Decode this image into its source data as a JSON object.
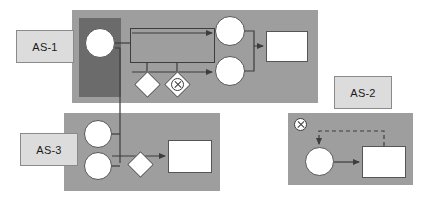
{
  "diagram": {
    "colors": {
      "panel_fill": "#9e9e9e",
      "panel_dark_fill": "#6b6b6b",
      "label_fill": "#dcdcdc",
      "label_border": "#8a8a8a",
      "node_fill": "#ffffff",
      "node_border": "#555555",
      "edge_stroke": "#3d3d3d",
      "background": "#ffffff"
    },
    "panels": [
      {
        "name": "as1-panel",
        "label": "AS-1",
        "x": 72,
        "y": 10,
        "width": 246,
        "height": 93,
        "fill": "#9e9e9e"
      },
      {
        "name": "as1-dark-overlay",
        "label": "",
        "x": 79,
        "y": 18,
        "width": 42,
        "height": 79,
        "fill": "#6b6b6b"
      },
      {
        "name": "as3-panel",
        "label": "AS-3",
        "x": 64,
        "y": 113,
        "width": 156,
        "height": 78,
        "fill": "#9e9e9e"
      },
      {
        "name": "as2-panel",
        "label": "AS-2",
        "x": 288,
        "y": 113,
        "width": 125,
        "height": 72,
        "fill": "#9e9e9e"
      }
    ],
    "labels": [
      {
        "name": "as1-label",
        "text": "AS-1",
        "x": 16,
        "y": 30,
        "width": 58,
        "height": 33
      },
      {
        "name": "as3-label",
        "text": "AS-3",
        "x": 20,
        "y": 133,
        "width": 58,
        "height": 33
      },
      {
        "name": "as2-label",
        "text": "AS-2",
        "x": 334,
        "y": 76,
        "width": 58,
        "height": 33
      }
    ],
    "nodes": [
      {
        "name": "as1-start-event",
        "type": "circle",
        "x": 85,
        "y": 28,
        "size": 30
      },
      {
        "name": "as1-task-upper-event",
        "type": "circle",
        "x": 215,
        "y": 16,
        "size": 30
      },
      {
        "name": "as1-task-lower-event",
        "type": "circle",
        "x": 215,
        "y": 56,
        "size": 30
      },
      {
        "name": "as1-end-task",
        "type": "rect",
        "x": 266,
        "y": 31,
        "width": 42,
        "height": 31
      },
      {
        "name": "as1-subprocess-frame",
        "type": "subproc",
        "x": 130,
        "y": 28,
        "width": 85,
        "height": 35
      },
      {
        "name": "as1-gateway-plain",
        "type": "diamond",
        "x": 138,
        "y": 75,
        "size": 19
      },
      {
        "name": "as1-gateway-exclusive",
        "type": "diamond-x",
        "x": 168,
        "y": 75,
        "size": 19
      },
      {
        "name": "as3-event-upper",
        "type": "circle",
        "x": 84,
        "y": 120,
        "size": 28
      },
      {
        "name": "as3-event-lower",
        "type": "circle",
        "x": 84,
        "y": 152,
        "size": 28
      },
      {
        "name": "as3-gateway-plain",
        "type": "diamond",
        "x": 131,
        "y": 155,
        "size": 19
      },
      {
        "name": "as3-end-task",
        "type": "rect",
        "x": 168,
        "y": 140,
        "width": 44,
        "height": 33
      },
      {
        "name": "as2-terminate-icon",
        "type": "x-icon",
        "x": 294,
        "y": 118,
        "size": 13
      },
      {
        "name": "as2-event",
        "type": "circle",
        "x": 305,
        "y": 147,
        "size": 29
      },
      {
        "name": "as2-task",
        "type": "rect",
        "x": 362,
        "y": 146,
        "width": 44,
        "height": 32
      }
    ],
    "edges": [
      {
        "name": "edge-as1-start-to-subprocess",
        "style": "solid",
        "arrow": false
      },
      {
        "name": "edge-subprocess-to-upper-event",
        "style": "solid",
        "arrow": true
      },
      {
        "name": "edge-subprocess-to-lower-event",
        "style": "solid",
        "arrow": true
      },
      {
        "name": "edge-events-merge-to-end-task",
        "style": "solid",
        "arrow": true
      },
      {
        "name": "edge-subprocess-to-gateway-plain",
        "style": "solid",
        "arrow": false
      },
      {
        "name": "edge-subprocess-to-gateway-exclusive",
        "style": "solid",
        "arrow": false
      },
      {
        "name": "edge-as1-start-down-to-as3",
        "style": "solid",
        "arrow": false
      },
      {
        "name": "edge-as3-upper-event-to-trunk",
        "style": "solid",
        "arrow": false
      },
      {
        "name": "edge-as3-lower-event-to-trunk",
        "style": "solid",
        "arrow": false
      },
      {
        "name": "edge-as3-trunk-to-end-task",
        "style": "solid",
        "arrow": true
      },
      {
        "name": "edge-as3-branch-to-gateway",
        "style": "solid",
        "arrow": false
      },
      {
        "name": "edge-as2-event-to-task",
        "style": "solid",
        "arrow": true
      },
      {
        "name": "edge-as2-task-feedback-loop",
        "style": "dashed",
        "arrow": true
      }
    ]
  }
}
